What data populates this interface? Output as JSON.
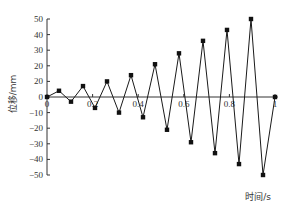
{
  "chart_data": {
    "type": "line",
    "title": "",
    "xlabel": "时间/s",
    "ylabel": "位移/mm",
    "xlim": [
      0,
      1
    ],
    "ylim": [
      -50,
      50
    ],
    "grid": false,
    "legend": "none",
    "x_ticks": [
      {
        "value": 0,
        "label": "0"
      },
      {
        "value": 0.2,
        "label": "0.2"
      },
      {
        "value": 0.4,
        "label": "0.4"
      },
      {
        "value": 0.6,
        "label": "0.6"
      },
      {
        "value": 0.8,
        "label": "0.8"
      },
      {
        "value": 1,
        "label": "1"
      }
    ],
    "y_ticks": [
      {
        "value": 50,
        "label": "50"
      },
      {
        "value": 40,
        "label": "40"
      },
      {
        "value": 30,
        "label": "30"
      },
      {
        "value": 20,
        "label": "20"
      },
      {
        "value": 10,
        "label": "20"
      },
      {
        "value": 0,
        "label": "0"
      },
      {
        "value": -10,
        "label": "-10"
      },
      {
        "value": -20,
        "label": "-20"
      },
      {
        "value": -30,
        "label": "-30"
      },
      {
        "value": -40,
        "label": "-40"
      },
      {
        "value": -50,
        "label": "-50"
      }
    ],
    "series": [
      {
        "name": "位移",
        "marker": "square",
        "color": "#111111",
        "x": [
          0,
          0.0526,
          0.1053,
          0.1579,
          0.2105,
          0.2632,
          0.3158,
          0.3684,
          0.4211,
          0.4737,
          0.5263,
          0.5789,
          0.6316,
          0.6842,
          0.7368,
          0.7895,
          0.8421,
          0.8947,
          0.9474,
          1.0
        ],
        "y": [
          0,
          4,
          -3,
          7,
          -7,
          10,
          -10,
          14,
          -13,
          21,
          -21,
          28,
          -29,
          36,
          -36,
          43,
          -43,
          50,
          -50,
          0
        ]
      }
    ]
  }
}
